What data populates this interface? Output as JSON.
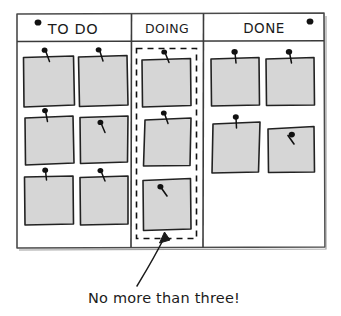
{
  "figure": {
    "style": "hand-drawn sketch",
    "background_color": "#ffffff",
    "ink_color": "#1a1a1a",
    "note_fill_color": "#d6d6d6",
    "note_border_color": "#222222",
    "pin_color": "#111111",
    "dashed_box_color": "#111111"
  },
  "board": {
    "name": "kanban-board",
    "outline_color": "#444444",
    "magnets": [
      {
        "name": "magnet-top-left",
        "position": "top-left"
      },
      {
        "name": "magnet-top-right",
        "position": "top-right"
      }
    ],
    "columns": [
      {
        "id": "todo",
        "header": "TO DO",
        "note_count": 6,
        "wip_limited": false,
        "notes": [
          {
            "id": "todo-note-1",
            "row": 1,
            "col": 1
          },
          {
            "id": "todo-note-2",
            "row": 1,
            "col": 2
          },
          {
            "id": "todo-note-3",
            "row": 2,
            "col": 1
          },
          {
            "id": "todo-note-4",
            "row": 2,
            "col": 2
          },
          {
            "id": "todo-note-5",
            "row": 3,
            "col": 1
          },
          {
            "id": "todo-note-6",
            "row": 3,
            "col": 2
          }
        ]
      },
      {
        "id": "doing",
        "header": "DOING",
        "note_count": 3,
        "wip_limited": true,
        "wip_limit": 3,
        "notes": [
          {
            "id": "doing-note-1",
            "row": 1,
            "col": 1
          },
          {
            "id": "doing-note-2",
            "row": 2,
            "col": 1
          },
          {
            "id": "doing-note-3",
            "row": 3,
            "col": 1
          }
        ]
      },
      {
        "id": "done",
        "header": "DONE",
        "note_count": 4,
        "wip_limited": false,
        "notes": [
          {
            "id": "done-note-1",
            "row": 1,
            "col": 1
          },
          {
            "id": "done-note-2",
            "row": 1,
            "col": 2
          },
          {
            "id": "done-note-3",
            "row": 2,
            "col": 1
          },
          {
            "id": "done-note-4",
            "row": 2,
            "col": 2
          }
        ]
      }
    ]
  },
  "annotation": {
    "name": "wip-limit-annotation",
    "text": "No more than three!",
    "points_to": "doing-column-dashed-box",
    "arrow": "curved-arrow-up"
  }
}
